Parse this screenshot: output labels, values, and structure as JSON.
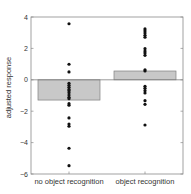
{
  "chart_data": {
    "type": "bar",
    "title": "",
    "xlabel": "",
    "ylabel": "adjusted response",
    "ylim": [
      -6,
      4
    ],
    "yticks": [
      -6,
      -4,
      -2,
      0,
      2,
      4
    ],
    "grid": false,
    "legend": null,
    "categories": [
      "no object recognition",
      "object recognition"
    ],
    "values": [
      -1.29,
      0.56
    ],
    "points": [
      [
        3.57,
        0.99,
        0.5,
        -0.22,
        -0.35,
        -0.48,
        -0.61,
        -0.69,
        -0.82,
        -0.97,
        -1.11,
        -1.2,
        -1.52,
        -1.62,
        -2.43,
        -2.82,
        -2.96,
        -4.36,
        -5.47
      ],
      [
        3.24,
        3.11,
        2.98,
        2.83,
        2.71,
        1.98,
        1.83,
        1.71,
        1.56,
        0.64,
        0.56,
        -0.41,
        -0.54,
        -0.69,
        -0.84,
        -1.33,
        -1.56,
        -2.88
      ]
    ],
    "colors": {
      "bar_fill": "#c8c8c8",
      "bar_edge": "#808080",
      "point": "#111111",
      "axis": "#808080"
    }
  }
}
